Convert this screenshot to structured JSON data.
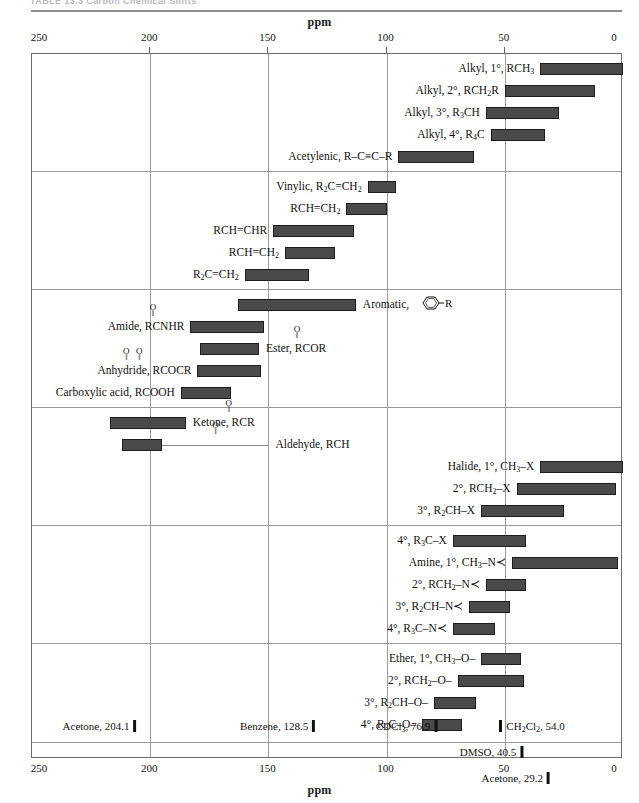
{
  "page": {
    "header": "TABLE 13.3   Carbon Chemical Shifts",
    "axis_title": "ppm",
    "axis_ticks": [
      250,
      200,
      150,
      100,
      50,
      0
    ],
    "axis_min_ppm": 0,
    "axis_max_ppm": 250
  },
  "chart_data": {
    "type": "bar",
    "orientation": "horizontal-ranges",
    "xlabel": "ppm",
    "ylabel": "",
    "xlim": [
      250,
      0
    ],
    "x_axis_reversed": true,
    "grid": true,
    "gridlines_ppm": [
      200,
      150,
      100,
      50
    ],
    "units": "ppm",
    "sections": [
      {
        "name": "alkyl-and-acetylenic",
        "rows": [
          {
            "label": "Alkyl, 1°, RCH3",
            "label_html": "Alkyl, 1°, RCH<sub>3</sub>",
            "start_ppm": 35,
            "end_ppm": 0,
            "label_side": "left"
          },
          {
            "label": "Alkyl, 2°, RCH2R",
            "label_html": "Alkyl, 2°, RCH<sub>2</sub>R",
            "start_ppm": 50,
            "end_ppm": 12,
            "label_side": "left"
          },
          {
            "label": "Alkyl, 3°, R3CH",
            "label_html": "Alkyl, 3°, R<sub>3</sub>CH",
            "start_ppm": 58,
            "end_ppm": 27,
            "label_side": "left"
          },
          {
            "label": "Alkyl, 4°, R4C",
            "label_html": "Alkyl, 4°, R<sub>4</sub>C",
            "start_ppm": 56,
            "end_ppm": 33,
            "label_side": "left"
          },
          {
            "label": "Acetylenic, R-C≡C-R",
            "label_html": "Acetylenic, R–C≡C–R",
            "start_ppm": 95,
            "end_ppm": 63,
            "label_side": "left"
          }
        ]
      },
      {
        "name": "vinylic",
        "rows": [
          {
            "label": "Vinylic, R2C=CH2",
            "label_html": "Vinylic, R<sub>2</sub>C=CH<sub>2</sub>",
            "start_ppm": 108,
            "end_ppm": 96,
            "label_side": "left"
          },
          {
            "label": "RCH=CH2",
            "label_html": "RCH=CH<sub>2</sub>",
            "start_ppm": 117,
            "end_ppm": 100,
            "label_side": "left"
          },
          {
            "label": "RCH=CHR",
            "label_html": "RCH=CHR",
            "start_ppm": 148,
            "end_ppm": 114,
            "label_side": "left"
          },
          {
            "label": "RCH=CH2",
            "label_html": "RCH=CH<sub>2</sub>",
            "start_ppm": 143,
            "end_ppm": 122,
            "label_side": "left"
          },
          {
            "label": "R2C=CH2",
            "label_html": "R<sub>2</sub>C=CH<sub>2</sub>",
            "start_ppm": 160,
            "end_ppm": 133,
            "label_side": "left"
          }
        ]
      },
      {
        "name": "aromatic-and-carbonyl",
        "rows": [
          {
            "label": "Aromatic, ring-R",
            "label_html": "Aromatic,",
            "start_ppm": 163,
            "end_ppm": 113,
            "label_side": "right",
            "has_ring": true
          },
          {
            "label": "Amide, RCNHR",
            "label_html": "Amide, RCNHR",
            "start_ppm": 183,
            "end_ppm": 152,
            "label_side": "left",
            "carbonyl_offset_ch": 7
          },
          {
            "label": "Ester, RCOOR",
            "label_html": "Ester, RCOR",
            "start_ppm": 179,
            "end_ppm": 154,
            "label_side": "right",
            "carbonyl_offset_ch": 7
          },
          {
            "label": "Anhydride, RCOCR",
            "label_html": "Anhydride, RCOCR",
            "start_ppm": 180,
            "end_ppm": 153,
            "label_side": "left",
            "carbonyl_offset_ch": 11
          },
          {
            "label": "Carboxylic acid, RCOOH",
            "label_html": "Carboxylic acid, RCOOH",
            "start_ppm": 187,
            "end_ppm": 166,
            "label_side": "left"
          }
        ]
      },
      {
        "name": "ketone-aldehyde-halide",
        "rows": [
          {
            "label": "Ketone, RCR",
            "label_html": "Ketone, RCR",
            "start_ppm": 217,
            "end_ppm": 185,
            "label_side": "right",
            "carbonyl_offset_ch": 8
          },
          {
            "label": "Aldehyde, RCH",
            "label_html": "Aldehyde, RCH",
            "start_ppm": 212,
            "end_ppm": 195,
            "label_side": "right",
            "leader": true,
            "carbonyl_offset_ch": 10
          },
          {
            "label": "Halide, 1°, CH3-X",
            "label_html": "Halide, 1°, CH<sub>3</sub>–X",
            "start_ppm": 35,
            "end_ppm": 0,
            "label_side": "left"
          },
          {
            "label": "2°, RCH2-X",
            "label_html": "2°, RCH<sub>2</sub>–X",
            "start_ppm": 45,
            "end_ppm": 3,
            "label_side": "left"
          },
          {
            "label": "3°, R2CH-X",
            "label_html": "3°, R<sub>2</sub>CH–X",
            "start_ppm": 60,
            "end_ppm": 25,
            "label_side": "left"
          }
        ]
      },
      {
        "name": "amine",
        "rows": [
          {
            "label": "4°, R3C-X",
            "label_html": "4°, R<sub>3</sub>C–X",
            "start_ppm": 72,
            "end_ppm": 41,
            "label_side": "left"
          },
          {
            "label": "Amine, 1°, CH3-N",
            "label_html": "Amine, 1°, CH<sub>3</sub>–N≺",
            "start_ppm": 47,
            "end_ppm": 2,
            "label_side": "left"
          },
          {
            "label": "2°, RCH2-N",
            "label_html": "2°, RCH<sub>2</sub>–N≺",
            "start_ppm": 58,
            "end_ppm": 41,
            "label_side": "left"
          },
          {
            "label": "3°, R2CH-N",
            "label_html": "3°, R<sub>2</sub>CH–N≺",
            "start_ppm": 65,
            "end_ppm": 48,
            "label_side": "left"
          },
          {
            "label": "4°, R3C-N",
            "label_html": "4°, R<sub>3</sub>C–N≺",
            "start_ppm": 72,
            "end_ppm": 54,
            "label_side": "left"
          }
        ]
      },
      {
        "name": "ether",
        "rows": [
          {
            "label": "Ether, 1°, CH3-O-",
            "label_html": "Ether, 1°, CH<sub>3</sub>–O–",
            "start_ppm": 60,
            "end_ppm": 43,
            "label_side": "left"
          },
          {
            "label": "2°, RCH2-O-",
            "label_html": "2°, RCH<sub>2</sub>–O–",
            "start_ppm": 70,
            "end_ppm": 42,
            "label_side": "left"
          },
          {
            "label": "3°, R2CH-O-",
            "label_html": "3°, R<sub>2</sub>CH–O–",
            "start_ppm": 80,
            "end_ppm": 62,
            "label_side": "left"
          },
          {
            "label": "4°, R3C-O-",
            "label_html": "4°, R<sub>3</sub>C–O–",
            "start_ppm": 85,
            "end_ppm": 68,
            "label_side": "left"
          }
        ]
      }
    ],
    "solvent_references": [
      {
        "label": "Acetone, 204.1",
        "label_html": "Acetone, 204.1",
        "ppm": 204.1,
        "row": 0,
        "side": "left"
      },
      {
        "label": "Benzene, 128.5",
        "label_html": "Benzene, 128.5",
        "ppm": 128.5,
        "row": 0,
        "side": "left"
      },
      {
        "label": "CDCl3, 76.9",
        "label_html": "CDCl<sub>3</sub>, 76.9",
        "ppm": 76.9,
        "row": 0,
        "side": "left"
      },
      {
        "label": "CH2Cl2, 54.0",
        "label_html": "CH<sub>2</sub>Cl<sub>2</sub>, 54.0",
        "ppm": 54.0,
        "row": 0,
        "side": "right"
      },
      {
        "label": "DMSO, 40.5",
        "label_html": "DMSO, 40.5",
        "ppm": 40.5,
        "row": 1,
        "side": "left"
      },
      {
        "label": "Acetone, 29.2",
        "label_html": "Acetone, 29.2",
        "ppm": 29.2,
        "row": 2,
        "side": "left"
      }
    ]
  }
}
